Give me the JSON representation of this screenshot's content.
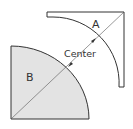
{
  "diagram": {
    "labels": {
      "shape_a": "A",
      "shape_b": "B",
      "center": "Center"
    },
    "colors": {
      "stroke": "#333333",
      "fill_b": "#e3e3e3",
      "fill_a": "#ffffff",
      "background": "#ffffff"
    }
  }
}
